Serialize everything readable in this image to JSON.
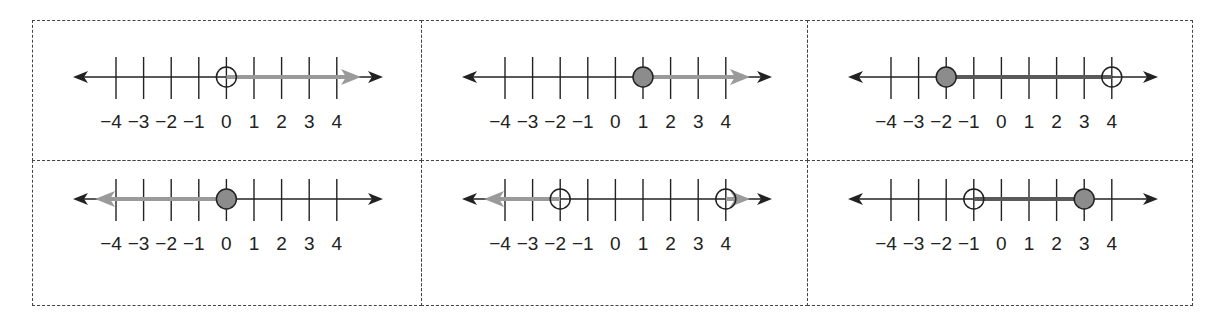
{
  "worksheet": {
    "description": "Six number lines showing inequality solution sets",
    "colors": {
      "axis": "#222222",
      "ray_gray": "#9a9a9a",
      "segment_dark": "#5a5a5a",
      "closed_dot_fill": "#8c8c8c",
      "border": "#444444"
    },
    "tick_values": [
      -4,
      -3,
      -2,
      -1,
      0,
      1,
      2,
      3,
      4
    ],
    "tick_labels": [
      "−4",
      "−3",
      "−2",
      "−1",
      "0",
      "1",
      "2",
      "3",
      "4"
    ],
    "panels": [
      {
        "id": "panel-1",
        "inequality": "x > 0",
        "points": [
          {
            "value": 0,
            "type": "open"
          }
        ],
        "shading": [
          {
            "from": 0,
            "to": "+inf",
            "style": "gray-ray"
          }
        ]
      },
      {
        "id": "panel-2",
        "inequality": "x ≥ 1",
        "points": [
          {
            "value": 1,
            "type": "closed"
          }
        ],
        "shading": [
          {
            "from": 1,
            "to": "+inf",
            "style": "gray-ray"
          }
        ]
      },
      {
        "id": "panel-3",
        "inequality": "−2 ≤ x < 4",
        "points": [
          {
            "value": -2,
            "type": "closed"
          },
          {
            "value": 4,
            "type": "open"
          }
        ],
        "shading": [
          {
            "from": -2,
            "to": 4,
            "style": "dark-segment"
          }
        ]
      },
      {
        "id": "panel-4",
        "inequality": "x ≤ 0",
        "points": [
          {
            "value": 0,
            "type": "closed"
          }
        ],
        "shading": [
          {
            "from": "-inf",
            "to": 0,
            "style": "gray-ray"
          }
        ]
      },
      {
        "id": "panel-5",
        "inequality": "x < −2 or x > 4",
        "points": [
          {
            "value": -2,
            "type": "open"
          },
          {
            "value": 4,
            "type": "open"
          }
        ],
        "shading": [
          {
            "from": "-inf",
            "to": -2,
            "style": "gray-ray"
          },
          {
            "from": 4,
            "to": "+inf",
            "style": "gray-ray"
          }
        ]
      },
      {
        "id": "panel-6",
        "inequality": "−1 < x ≤ 3",
        "points": [
          {
            "value": -1,
            "type": "open"
          },
          {
            "value": 3,
            "type": "closed"
          }
        ],
        "shading": [
          {
            "from": -1,
            "to": 3,
            "style": "dark-segment"
          }
        ]
      }
    ]
  }
}
